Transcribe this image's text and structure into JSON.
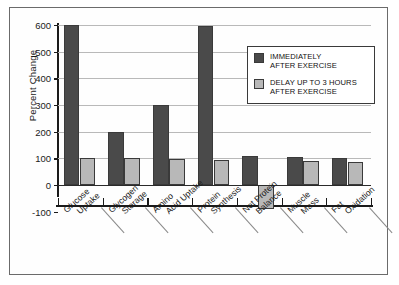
{
  "chart_data": {
    "type": "bar",
    "title": "",
    "xlabel": "",
    "ylabel": "Percent Change",
    "ylim": [
      -100,
      600
    ],
    "ytick_values": [
      600,
      500,
      400,
      300,
      200,
      100,
      0,
      -100
    ],
    "ytick_labels": [
      "600",
      "500",
      "400",
      "300",
      "200",
      "100",
      "0",
      "-100"
    ],
    "grid": true,
    "legend_position": "upper-right",
    "categories": [
      "Glucose Uptake",
      "Glycogen Storage",
      "Amino Acid Uptake",
      "Protein Synthesis",
      "Net Protein Balance",
      "Muscle Mass",
      "Fat Oxidation"
    ],
    "category_lines": [
      [
        "Glucose",
        "Uptake"
      ],
      [
        "Glycogen",
        "Storage"
      ],
      [
        "Amino",
        "Acid Uptake"
      ],
      [
        "Protein",
        "Synthesis"
      ],
      [
        "Net Protein",
        "Balance"
      ],
      [
        "Muscle",
        "Mass"
      ],
      [
        "Fat",
        "Oxidation"
      ]
    ],
    "series": [
      {
        "name": "IMMEDIATELY AFTER EXERCISE",
        "color": "#4a4a4a",
        "values": [
          600,
          200,
          300,
          595,
          108,
          105,
          103
        ]
      },
      {
        "name": "DELAY UP TO 3 HOURS AFTER EXERCISE",
        "color": "#b8b8b8",
        "values": [
          100,
          100,
          96,
          95,
          -90,
          90,
          88
        ]
      }
    ]
  },
  "axis": {
    "y_title": "Percent Change"
  },
  "legend": {
    "entries": [
      {
        "line1": "IMMEDIATELY",
        "line2": "AFTER EXERCISE",
        "swatch": "dark"
      },
      {
        "line1": "DELAY UP TO 3 HOURS",
        "line2": "AFTER EXERCISE",
        "swatch": "light"
      }
    ]
  },
  "colors": {
    "series_dark": "#4a4a4a",
    "series_light": "#b8b8b8",
    "axis": "#1a1a1a",
    "grid": "#b9b9b9",
    "frame": "#6b6b6b"
  }
}
